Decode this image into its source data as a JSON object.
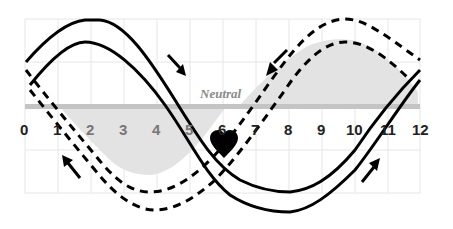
{
  "diagram": {
    "neutral_label": "Neutral",
    "x_ticks": [
      "0",
      "1",
      "2",
      "3",
      "4",
      "5",
      "6",
      "7",
      "8",
      "9",
      "10",
      "11",
      "12"
    ],
    "colors": {
      "stroke": "#000000",
      "neutral_band": "#c4c4c4",
      "shaded_area": "#e3e3e3",
      "grid": "#e6e6e6",
      "background": "#ffffff"
    },
    "elements": {
      "solid_band": "Solid double sine band (peak near 2.5, trough near 8.5)",
      "dashed_band": "Dashed double sine band (trough near 4.5, peak near 10.5)",
      "heart": "Heart at crossing point x=6",
      "arrows": [
        {
          "position": "near 4.5 upper",
          "direction": "down-right"
        },
        {
          "position": "near 7.5 upper",
          "direction": "down-left"
        },
        {
          "position": "near 1 lower",
          "direction": "up-left"
        },
        {
          "position": "near 11 lower",
          "direction": "up-right"
        }
      ]
    }
  }
}
